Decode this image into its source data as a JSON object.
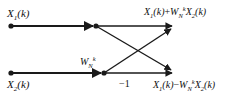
{
  "figure": {
    "stroke_color": "#1a1a1a",
    "background_color": "#ffffff"
  },
  "inputs": [
    {
      "id": "x1",
      "base": "X",
      "sub": "1",
      "arg": "(k)",
      "text": "X₁(k)"
    },
    {
      "id": "x2",
      "base": "X",
      "sub": "2",
      "arg": "(k)",
      "text": "X₂(k)"
    }
  ],
  "coefficients": {
    "twiddle": {
      "base": "W",
      "sub": "N",
      "sup": "k",
      "text": "W_N^k"
    },
    "inverter": {
      "text": "−1"
    }
  },
  "outputs": [
    {
      "id": "sum",
      "terms": [
        "X₁(k)",
        "+",
        "W_N^k",
        "X₂(k)"
      ],
      "parts": {
        "x1_base": "X",
        "x1_sub": "1",
        "x1_arg": "(k)",
        "operator": "+",
        "w_base": "W",
        "w_sub": "N",
        "w_sup": "k",
        "x2_base": "X",
        "x2_sub": "2",
        "x2_arg": "(k)"
      },
      "text": "X₁(k)+W_N^k X₂(k)"
    },
    {
      "id": "diff",
      "terms": [
        "X₁(k)",
        "−",
        "W_N^k",
        "X₂(k)"
      ],
      "parts": {
        "x1_base": "X",
        "x1_sub": "1",
        "x1_arg": "(k)",
        "operator": "−",
        "w_base": "W",
        "w_sub": "N",
        "w_sup": "k",
        "x2_base": "X",
        "x2_sub": "2",
        "x2_arg": "(k)"
      },
      "text": "X₁(k)−W_N^k X₂(k)"
    }
  ],
  "nodes": [
    {
      "id": "in-top",
      "x": 11,
      "y": 26
    },
    {
      "id": "in-bot",
      "x": 11,
      "y": 73
    },
    {
      "id": "mid-top",
      "x": 96,
      "y": 26
    },
    {
      "id": "mid-bot",
      "x": 104,
      "y": 73
    },
    {
      "id": "out-top",
      "x": 176,
      "y": 26
    },
    {
      "id": "out-bot",
      "x": 176,
      "y": 73
    }
  ]
}
